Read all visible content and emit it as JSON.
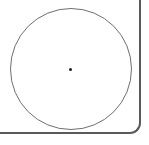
{
  "figure": {
    "background_color": "#ffffff",
    "width": 149,
    "height": 145
  },
  "panel": {
    "name": "panel-frame",
    "border_color": "#5a5a5a",
    "border_width_px": 2,
    "corner_radius_px": 11,
    "visible_edges": "right, bottom",
    "corner_style": "rounded bottom-right"
  },
  "shapes": {
    "circle": {
      "label": "circle",
      "stroke_color": "#6e6e76",
      "stroke_width_px": 1,
      "fill": "none",
      "center_x": 71,
      "center_y": 69,
      "radius_px": 61,
      "diameter_px": 122
    },
    "center_point": {
      "label": "center point",
      "color": "#1a1a1a",
      "x": 71,
      "y": 69,
      "size_px": 3
    }
  }
}
